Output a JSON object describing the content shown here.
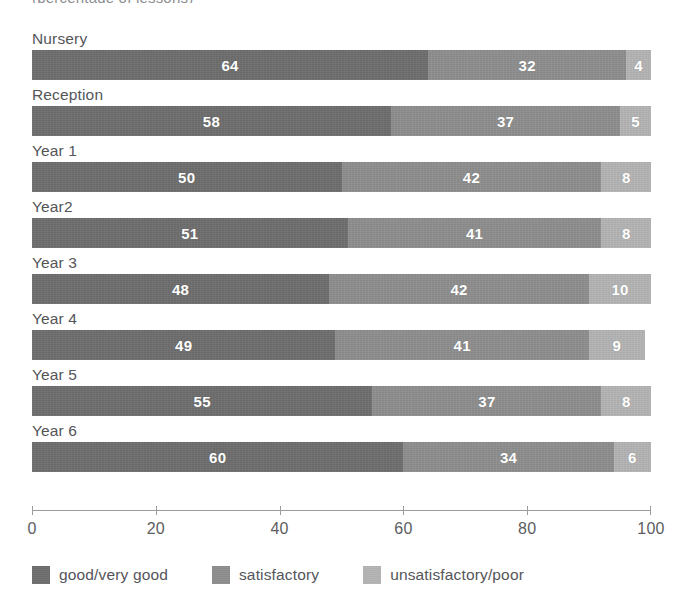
{
  "clipped_heading": "(percentage of lessons)",
  "chart_data": {
    "type": "bar",
    "orientation": "horizontal",
    "stacked": true,
    "title": "",
    "subtitle": "",
    "xlabel": "",
    "ylabel": "",
    "xlim": [
      0,
      100
    ],
    "xticks": [
      0,
      20,
      40,
      60,
      80,
      100
    ],
    "xtick_labels": [
      "0",
      "20",
      "40",
      "60",
      "80",
      "100"
    ],
    "grid": false,
    "legend_position": "bottom-left",
    "categories": [
      "Nursery",
      "Reception",
      "Year 1",
      "Year2",
      "Year 3",
      "Year 4",
      "Year 5",
      "Year 6"
    ],
    "series": [
      {
        "name": "good/very good",
        "color": "#6e6e6e",
        "values": [
          64,
          58,
          50,
          51,
          48,
          49,
          55,
          60
        ]
      },
      {
        "name": "satisfactory",
        "color": "#8e8e8e",
        "values": [
          32,
          37,
          42,
          41,
          42,
          41,
          37,
          34
        ]
      },
      {
        "name": "unsatisfactory/poor",
        "color": "#b4b4b4",
        "values": [
          4,
          5,
          8,
          8,
          10,
          9,
          8,
          6
        ]
      }
    ]
  },
  "axis": {
    "line_color": "#9a9a9f"
  },
  "colors": {
    "good": "#6e6e6e",
    "satisfactory": "#8e8e8e",
    "unsatisfactory": "#b4b4b4",
    "text": "#55555a",
    "value_text": "#ffffff",
    "background": "#ffffff"
  }
}
